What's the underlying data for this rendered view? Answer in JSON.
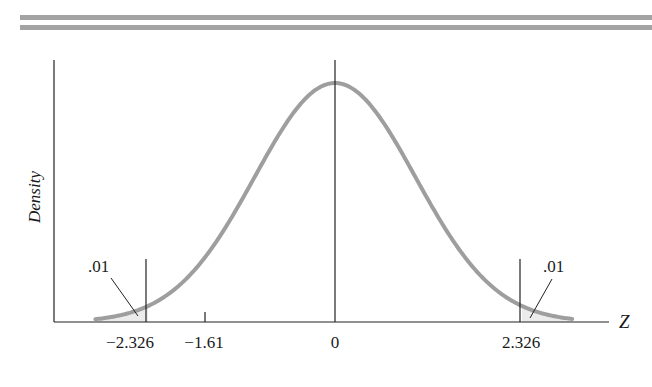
{
  "chart_data": {
    "type": "line",
    "title": "",
    "xlabel": "Z",
    "ylabel": "Density",
    "distribution": "standard normal",
    "x_ticks": [
      {
        "value": -2.326,
        "label": "−2.326"
      },
      {
        "value": -1.61,
        "label": "−1.61"
      },
      {
        "value": 0,
        "label": "0"
      },
      {
        "value": 2.326,
        "label": "2.326"
      }
    ],
    "critical_values": [
      -2.326,
      2.326
    ],
    "tail_areas": [
      {
        "side": "left",
        "bound": -2.326,
        "area": ".01"
      },
      {
        "side": "right",
        "bound": 2.326,
        "area": ".01"
      }
    ],
    "xlim": [
      -3.0,
      3.0
    ],
    "grid": false,
    "legend": "none",
    "curve_color": "#9e9e9e",
    "shade_color": "#ececec"
  },
  "labels": {
    "ylabel": "Density",
    "xlabel": "Z",
    "left_tail": ".01",
    "right_tail": ".01",
    "tick_neg2326": "−2.326",
    "tick_neg161": "−1.61",
    "tick_0": "0",
    "tick_2326": "2.326"
  }
}
